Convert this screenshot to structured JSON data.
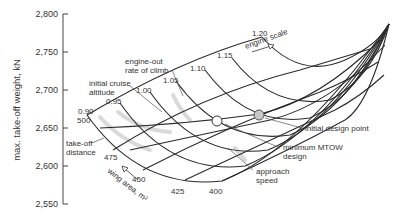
{
  "chart_data": {
    "type": "carpet",
    "title": "",
    "ylabel": "max. take-off weight, kN",
    "ylim": [
      2550,
      2800
    ],
    "yticks": [
      2550,
      2600,
      2650,
      2700,
      2750,
      2800
    ],
    "ytick_labels": [
      "2,550",
      "2,600",
      "2,650",
      "2,700",
      "2,750",
      "2,800"
    ],
    "carpet_axes": {
      "engine_scale": {
        "label": "engine scale",
        "values": [
          0.9,
          0.95,
          1.0,
          1.05,
          1.1,
          1.15,
          1.2
        ],
        "labels": [
          "0.90",
          "0.95",
          "1.00",
          "1.05",
          "1.10",
          "1.15",
          "1.20"
        ]
      },
      "wing_area": {
        "label": "wing area, m²",
        "values": [
          500,
          475,
          450,
          425,
          400
        ],
        "labels": [
          "500",
          "475",
          "450",
          "425",
          "400"
        ]
      }
    },
    "constraint_lines": [
      "take-off distance",
      "initial cruise altitude",
      "engine-out rate of climb",
      "approach speed"
    ],
    "points": [
      {
        "name": "minimum MTOW design",
        "marker": "open-circle",
        "mtow_approx": 2656
      },
      {
        "name": "initial design point",
        "marker": "gray-circle",
        "mtow_approx": 2664
      }
    ],
    "grid": false,
    "legend": "none"
  },
  "labels": {
    "ylabel": "max. take-off weight, kN",
    "engine_scale_title": "engine scale",
    "wing_area_title": "wing area, m²",
    "takeoff": [
      "take-off",
      "distance"
    ],
    "cruise": [
      "initial cruise",
      "altitude"
    ],
    "climb": [
      "engine-out",
      "rate of climb"
    ],
    "approach": [
      "approach",
      "speed"
    ],
    "min_mtow": [
      "minimum MTOW",
      "design"
    ],
    "initial_point": "initial design point"
  },
  "colors": {
    "line": "#2a2a2a",
    "text": "#333333",
    "shade": "#cfcfcf",
    "initial_point_fill": "#c8c8c8",
    "min_point_fill": "#ffffff"
  }
}
